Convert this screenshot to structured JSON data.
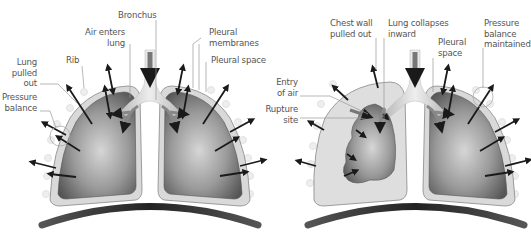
{
  "diagram": {
    "panels": [
      {
        "id": "normal",
        "labels": {
          "bronchus": "Bronchus",
          "air_enters_lung": "Air enters\nlung",
          "pleural_membranes": "Pleural\nmembranes",
          "rib": "Rib",
          "pleural_space": "Pleural space",
          "lung_pulled_out": "Lung\npulled\nout",
          "pressure_balance": "Pressure\nbalance"
        }
      },
      {
        "id": "collapsed",
        "labels": {
          "chest_wall_pulled_out": "Chest wall\npulled out",
          "lung_collapses_inward": "Lung collapses\ninward",
          "pressure_balance_maintained": "Pressure\nbalance\nmaintained",
          "pleural_space": "Pleural\nspace",
          "entry_of_air": "Entry\nof air",
          "rupture_site": "Rupture\nsite"
        }
      }
    ],
    "colors": {
      "pleura_fill": "#d9d9d9",
      "lung_dark": "#5a5a5a",
      "lung_light": "#d0d0d0",
      "diaphragm": "#333333",
      "arrow": "#1a1a1a",
      "leader_line": "#999999",
      "label_text": "#555555"
    }
  }
}
